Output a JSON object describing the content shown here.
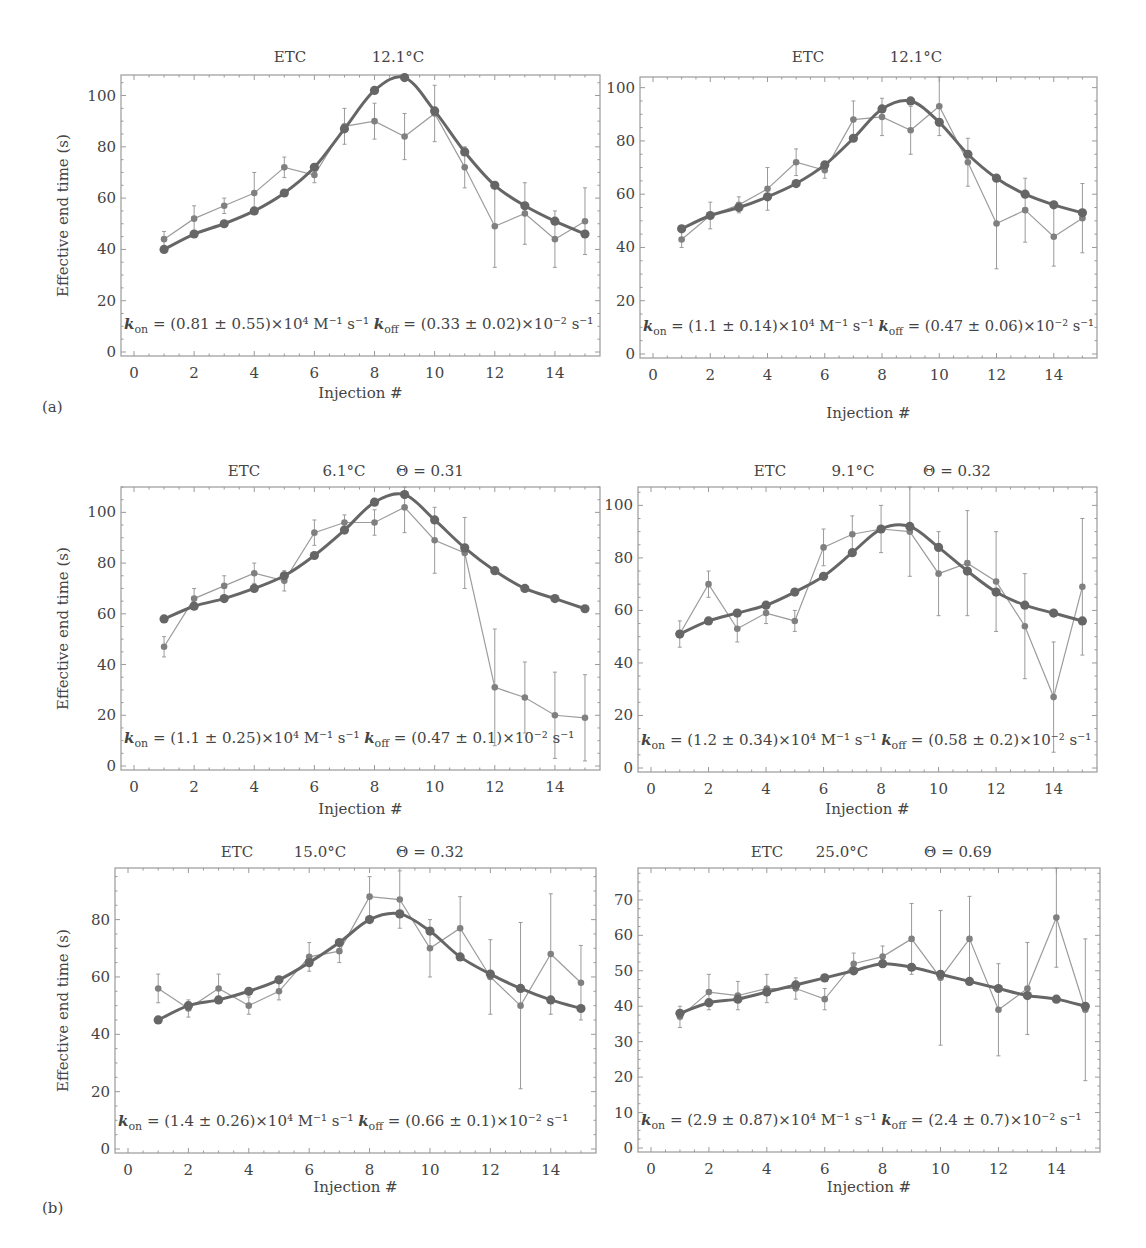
{
  "figure": {
    "panel_labels": [
      "(a)",
      "(b)"
    ],
    "y_axis_label": "Effective end time (s)",
    "x_axis_label": "Injection #"
  },
  "colors": {
    "fit": "#666666",
    "data": "#808080",
    "axes": "#9a9a9a",
    "text": "#444444"
  },
  "chart_data": [
    {
      "id": "a-left",
      "type": "line",
      "title_parts": [
        "ETC",
        "12.1°C"
      ],
      "xlabel": "Injection #",
      "ylabel": "Effective end time (s)",
      "xlim": [
        0,
        15.3
      ],
      "ylim": [
        0,
        108
      ],
      "xticks": [
        0,
        2,
        4,
        6,
        8,
        10,
        12,
        14
      ],
      "yticks": [
        0,
        20,
        40,
        60,
        80,
        100
      ],
      "annotation": {
        "kon": "(0.81 ± 0.55)×10⁴ M⁻¹ s⁻¹",
        "koff": "(0.33 ± 0.02)×10⁻² s⁻¹"
      },
      "x": [
        1,
        2,
        3,
        4,
        5,
        6,
        7,
        8,
        9,
        10,
        11,
        12,
        13,
        14,
        15
      ],
      "series": [
        {
          "name": "fit",
          "values": [
            40,
            46,
            50,
            55,
            62,
            72,
            87,
            102,
            107,
            94,
            78,
            65,
            57,
            51,
            46
          ]
        },
        {
          "name": "measured",
          "values": [
            44,
            52,
            57,
            62,
            72,
            69,
            88,
            90,
            84,
            93,
            72,
            49,
            54,
            44,
            51
          ],
          "err": [
            3,
            5,
            3,
            8,
            4,
            3,
            7,
            7,
            9,
            11,
            8,
            16,
            12,
            11,
            13
          ]
        }
      ]
    },
    {
      "id": "a-right",
      "type": "line",
      "title_parts": [
        "ETC",
        "12.1°C"
      ],
      "xlabel": "Injection #",
      "ylabel": "",
      "xlim": [
        0,
        15.3
      ],
      "ylim": [
        0,
        104
      ],
      "xticks": [
        0,
        2,
        4,
        6,
        8,
        10,
        12,
        14
      ],
      "yticks": [
        0,
        20,
        40,
        60,
        80,
        100
      ],
      "annotation": {
        "kon": "(1.1 ± 0.14)×10⁴ M⁻¹ s⁻¹",
        "koff": "(0.47 ± 0.06)×10⁻² s⁻¹"
      },
      "x": [
        1,
        2,
        3,
        4,
        5,
        6,
        7,
        8,
        9,
        10,
        11,
        12,
        13,
        14,
        15
      ],
      "series": [
        {
          "name": "fit",
          "values": [
            47,
            52,
            55,
            59,
            64,
            71,
            81,
            92,
            95,
            87,
            75,
            66,
            60,
            56,
            53
          ]
        },
        {
          "name": "measured",
          "values": [
            43,
            52,
            56,
            62,
            72,
            69,
            88,
            89,
            84,
            93,
            72,
            49,
            54,
            44,
            51
          ],
          "err": [
            3,
            5,
            3,
            8,
            5,
            3,
            7,
            7,
            9,
            11,
            9,
            17,
            12,
            11,
            13
          ]
        }
      ]
    },
    {
      "id": "b-mid-left",
      "type": "line",
      "title_parts": [
        "ETC",
        "6.1°C",
        "Θ = 0.31"
      ],
      "xlabel": "Injection #",
      "ylabel": "Effective end time (s)",
      "xlim": [
        0,
        15.3
      ],
      "ylim": [
        0,
        110
      ],
      "xticks": [
        0,
        2,
        4,
        6,
        8,
        10,
        12,
        14
      ],
      "yticks": [
        0,
        20,
        40,
        60,
        80,
        100
      ],
      "annotation": {
        "kon": "(1.1 ± 0.25)×10⁴ M⁻¹ s⁻¹",
        "koff": "(0.47 ± 0.1)×10⁻² s⁻¹"
      },
      "x": [
        1,
        2,
        3,
        4,
        5,
        6,
        7,
        8,
        9,
        10,
        11,
        12,
        13,
        14,
        15
      ],
      "series": [
        {
          "name": "fit",
          "values": [
            58,
            63,
            66,
            70,
            75,
            83,
            93,
            104,
            107,
            97,
            86,
            77,
            70,
            66,
            62
          ]
        },
        {
          "name": "measured",
          "values": [
            47,
            66,
            71,
            76,
            73,
            92,
            96,
            96,
            102,
            89,
            84,
            31,
            27,
            20,
            19
          ],
          "err": [
            4,
            4,
            4,
            4,
            4,
            5,
            3,
            5,
            10,
            13,
            14,
            23,
            14,
            17,
            17
          ]
        }
      ]
    },
    {
      "id": "b-mid-right",
      "type": "line",
      "title_parts": [
        "ETC",
        "9.1°C",
        "Θ = 0.32"
      ],
      "xlabel": "Injection #",
      "ylabel": "",
      "xlim": [
        0,
        15.3
      ],
      "ylim": [
        0,
        107
      ],
      "xticks": [
        0,
        2,
        4,
        6,
        8,
        10,
        12,
        14
      ],
      "yticks": [
        0,
        20,
        40,
        60,
        80,
        100
      ],
      "annotation": {
        "kon": "(1.2 ± 0.34)×10⁴ M⁻¹ s⁻¹",
        "koff": "(0.58 ± 0.2)×10⁻² s⁻¹"
      },
      "x": [
        1,
        2,
        3,
        4,
        5,
        6,
        7,
        8,
        9,
        10,
        11,
        12,
        13,
        14,
        15
      ],
      "series": [
        {
          "name": "fit",
          "values": [
            51,
            56,
            59,
            62,
            67,
            73,
            82,
            91,
            92,
            84,
            75,
            67,
            62,
            59,
            56
          ]
        },
        {
          "name": "measured",
          "values": [
            51,
            70,
            53,
            59,
            56,
            84,
            89,
            91,
            90,
            74,
            78,
            71,
            54,
            27,
            69
          ],
          "err": [
            5,
            5,
            5,
            4,
            4,
            7,
            7,
            9,
            17,
            16,
            20,
            19,
            20,
            21,
            26
          ]
        }
      ]
    },
    {
      "id": "b-bottom-left",
      "type": "line",
      "title_parts": [
        "ETC",
        "15.0°C",
        "Θ = 0.32"
      ],
      "xlabel": "Injection #",
      "ylabel": "Effective end time (s)",
      "xlim": [
        0,
        15.3
      ],
      "ylim": [
        0,
        98
      ],
      "xticks": [
        0,
        2,
        4,
        6,
        8,
        10,
        12,
        14
      ],
      "yticks": [
        0,
        20,
        40,
        60,
        80
      ],
      "annotation": {
        "kon": "(1.4 ± 0.26)×10⁴ M⁻¹ s⁻¹",
        "koff": "(0.66 ± 0.1)×10⁻² s⁻¹"
      },
      "x": [
        1,
        2,
        3,
        4,
        5,
        6,
        7,
        8,
        9,
        10,
        11,
        12,
        13,
        14,
        15
      ],
      "series": [
        {
          "name": "fit",
          "values": [
            45,
            50,
            52,
            55,
            59,
            65,
            72,
            80,
            82,
            76,
            67,
            61,
            56,
            52,
            49
          ]
        },
        {
          "name": "measured",
          "values": [
            56,
            49,
            56,
            50,
            55,
            67,
            69,
            88,
            87,
            70,
            77,
            60,
            50,
            68,
            58
          ],
          "err": [
            5,
            3,
            5,
            3,
            3,
            5,
            4,
            7,
            10,
            10,
            11,
            13,
            29,
            21,
            13
          ]
        }
      ]
    },
    {
      "id": "b-bottom-right",
      "type": "line",
      "title_parts": [
        "ETC",
        "25.0°C",
        "Θ = 0.69"
      ],
      "xlabel": "Injection #",
      "ylabel": "",
      "xlim": [
        0,
        15.3
      ],
      "ylim": [
        0,
        79
      ],
      "xticks": [
        0,
        2,
        4,
        6,
        8,
        10,
        12,
        14
      ],
      "yticks": [
        0,
        10,
        20,
        30,
        40,
        50,
        60,
        70
      ],
      "annotation": {
        "kon": "(2.9 ± 0.87)×10⁴ M⁻¹ s⁻¹",
        "koff": "(2.4 ± 0.7)×10⁻² s⁻¹"
      },
      "x": [
        1,
        2,
        3,
        4,
        5,
        6,
        7,
        8,
        9,
        10,
        11,
        12,
        13,
        14,
        15
      ],
      "series": [
        {
          "name": "fit",
          "values": [
            38,
            41,
            42,
            44,
            46,
            48,
            50,
            52,
            51,
            49,
            47,
            45,
            43,
            42,
            40
          ]
        },
        {
          "name": "measured",
          "values": [
            37,
            44,
            43,
            45,
            45,
            42,
            52,
            54,
            59,
            48,
            59,
            39,
            45,
            65,
            39
          ],
          "err": [
            3,
            5,
            4,
            4,
            3,
            3,
            3,
            3,
            10,
            19,
            12,
            13,
            13,
            14,
            20
          ]
        }
      ]
    }
  ]
}
